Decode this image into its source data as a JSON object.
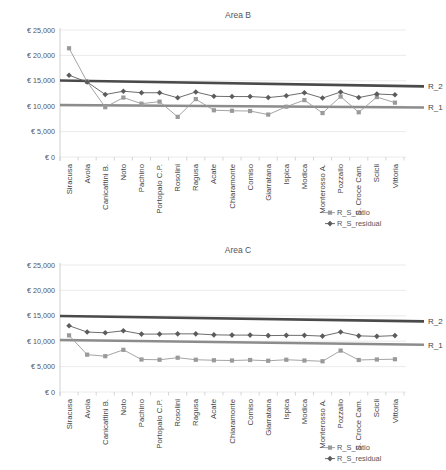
{
  "page": {
    "background": "#ffffff"
  },
  "colors": {
    "ratio": "#9a9a9a",
    "residual": "#5c5c5c",
    "r1": "#8c8c8c",
    "r2": "#4a4a4a",
    "grid": "#e2e2e2",
    "text": "#555555"
  },
  "axis": {
    "y_ticks": [
      "€ 25,000",
      "€ 20,000",
      "€ 15,000",
      "€ 10,000",
      "€ 5,000",
      "€ 0"
    ],
    "y_values": [
      25000,
      20000,
      15000,
      10000,
      5000,
      0
    ],
    "ymin": 0,
    "ymax": 25000
  },
  "categories": [
    "Siracusa",
    "Avola",
    "Canicattini B.",
    "Noto",
    "Pachino",
    "Portopalo C.P.",
    "Rosolini",
    "Ragusa",
    "Acate",
    "Chiaramonte",
    "Comiso",
    "Giarratana",
    "Ispica",
    "Modica",
    "Monterosso A.",
    "Pozzallo",
    "S. Croce Cam.",
    "Scicli",
    "Vittoria"
  ],
  "legend": [
    {
      "label": "R_S_ratio",
      "marker": "square",
      "color": "#9a9a9a"
    },
    {
      "label": "R_S_residual",
      "marker": "diamond",
      "color": "#5c5c5c"
    }
  ],
  "reference_labels": {
    "r1": "R_1",
    "r2": "R_2"
  },
  "chart_data": [
    {
      "type": "line",
      "title": "Area B",
      "xlabel": "",
      "ylabel": "",
      "ylim": [
        0,
        25000
      ],
      "grid": true,
      "legend_position": "bottom-right",
      "categories": [
        "Siracusa",
        "Avola",
        "Canicattini B.",
        "Noto",
        "Pachino",
        "Portopalo C.P.",
        "Rosolini",
        "Ragusa",
        "Acate",
        "Chiaramonte",
        "Comiso",
        "Giarratana",
        "Ispica",
        "Modica",
        "Monterosso A.",
        "Pozzallo",
        "S. Croce Cam.",
        "Scicli",
        "Vittoria"
      ],
      "series": [
        {
          "name": "R_S_ratio",
          "marker": "square",
          "color": "#9a9a9a",
          "values": [
            21400,
            14800,
            9800,
            11700,
            10500,
            10900,
            7900,
            11400,
            9200,
            9100,
            9050,
            8350,
            9900,
            11200,
            8650,
            11900,
            8800,
            11800,
            10700
          ]
        },
        {
          "name": "R_S_residual",
          "marker": "diamond",
          "color": "#5c5c5c",
          "values": [
            16100,
            14750,
            12300,
            12950,
            12650,
            12650,
            11650,
            12800,
            11950,
            11900,
            11900,
            11700,
            12050,
            12650,
            11600,
            12800,
            11700,
            12400,
            12250
          ]
        }
      ],
      "reference_lines": [
        {
          "name": "R_2",
          "color": "#4a4a4a",
          "y_start": 15050,
          "y_end": 13900,
          "width": 2.6
        },
        {
          "name": "R_1",
          "color": "#8c8c8c",
          "y_start": 10250,
          "y_end": 9750,
          "width": 2.6
        }
      ]
    },
    {
      "type": "line",
      "title": "Area C",
      "xlabel": "",
      "ylabel": "",
      "ylim": [
        0,
        25000
      ],
      "grid": true,
      "legend_position": "bottom-right",
      "categories": [
        "Siracusa",
        "Avola",
        "Canicattini B.",
        "Noto",
        "Pachino",
        "Portopalo C.P.",
        "Rosolini",
        "Ragusa",
        "Acate",
        "Chiaramonte",
        "Comiso",
        "Giarratana",
        "Ispica",
        "Modica",
        "Monterosso A.",
        "Pozzallo",
        "S. Croce Cam.",
        "Scicli",
        "Vittoria"
      ],
      "series": [
        {
          "name": "R_S_ratio",
          "marker": "square",
          "color": "#9a9a9a",
          "values": [
            11150,
            7350,
            7050,
            8300,
            6400,
            6350,
            6750,
            6350,
            6250,
            6200,
            6300,
            6150,
            6350,
            6200,
            6050,
            8150,
            6300,
            6400,
            6450
          ]
        },
        {
          "name": "R_S_residual",
          "marker": "diamond",
          "color": "#5c5c5c",
          "values": [
            13050,
            11800,
            11650,
            12050,
            11400,
            11400,
            11450,
            11450,
            11250,
            11200,
            11200,
            11100,
            11150,
            11150,
            11000,
            11800,
            11050,
            10950,
            11100
          ]
        }
      ],
      "reference_lines": [
        {
          "name": "R_2",
          "color": "#4a4a4a",
          "y_start": 14950,
          "y_end": 13900,
          "width": 2.6
        },
        {
          "name": "R_1",
          "color": "#8c8c8c",
          "y_start": 10250,
          "y_end": 9300,
          "width": 2.6
        }
      ]
    }
  ]
}
